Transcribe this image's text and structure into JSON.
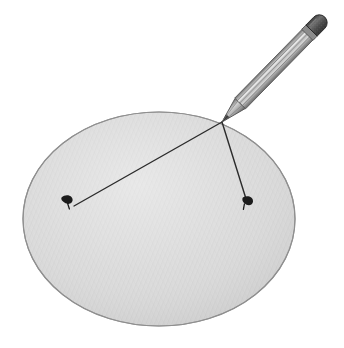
{
  "figure": {
    "background_color": "#ffffff",
    "width": 344,
    "height": 348,
    "alt_text": "A grey textured elliptical disc with a pencil touching its upper right area; two thin dark lines run from the pencil tip to two small dark pins on the disc."
  },
  "disc": {
    "label": "disc",
    "center_x": 159,
    "center_y": 219,
    "radius_x": 136,
    "radius_y": 107,
    "fill_color": "#d8d8d8",
    "edge_color": "#8f8f8f",
    "texture": "fine-diagonal-crosshatch",
    "texture_color": "#c4c4c4"
  },
  "pencil": {
    "label": "pencil",
    "tip_x": 222,
    "tip_y": 122,
    "cap_x": 318,
    "cap_y": 24,
    "body_color_light": "#cfcfcf",
    "body_color_mid": "#9a9a9a",
    "body_color_dark": "#6e6e6e",
    "outline_color": "#5a5a5a",
    "tip_color": "#3a3a3a",
    "eraser_color": "#4a4a4a",
    "eraser_speckle_color": "#8a8a8a",
    "facet_count": 4
  },
  "lines": [
    {
      "name": "long-chord-line",
      "label": "long line to left pin",
      "x1": 222,
      "y1": 122,
      "x2": 74,
      "y2": 206,
      "color": "#2b2b2b",
      "width": 1.4
    },
    {
      "name": "short-chord-line",
      "label": "short line to right pin",
      "x1": 222,
      "y1": 122,
      "x2": 247,
      "y2": 202,
      "color": "#2b2b2b",
      "width": 1.4
    }
  ],
  "pins": [
    {
      "name": "pin-left",
      "label": "left pin",
      "x": 69,
      "y": 201,
      "color": "#1c1c1c",
      "head_rx": 6,
      "head_ry": 4.5,
      "rotation": -18
    },
    {
      "name": "pin-right",
      "label": "right pin",
      "x": 248,
      "y": 202,
      "color": "#1c1c1c",
      "head_rx": 6,
      "head_ry": 4.5,
      "rotation": -18
    }
  ]
}
